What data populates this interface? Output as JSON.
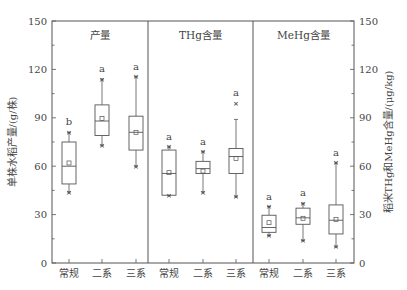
{
  "chart_data": {
    "type": "box",
    "title": "",
    "ylabel_left": "单株水稻产量/(g/株)",
    "ylabel_right": "稻米THg和MeHg含量/(μg/kg)",
    "ylim": [
      0,
      150
    ],
    "yticks": [
      0,
      30,
      60,
      90,
      120,
      150
    ],
    "grid": false,
    "categories": [
      "常规",
      "二系",
      "三系"
    ],
    "panels": [
      {
        "title": "产量",
        "axis": "left",
        "boxes": [
          {
            "category": "常规",
            "q1": 49,
            "median": 60,
            "q3": 75,
            "mean": 62,
            "whisker_low": 44,
            "whisker_high": 81,
            "min_marker": 44,
            "max_marker": 81,
            "sig": "b"
          },
          {
            "category": "二系",
            "q1": 79,
            "median": 88,
            "q3": 98,
            "mean": 89.5,
            "whisker_low": 73,
            "whisker_high": 114,
            "min_marker": 73,
            "max_marker": 114,
            "sig": "a"
          },
          {
            "category": "三系",
            "q1": 70,
            "median": 81,
            "q3": 91,
            "mean": 81,
            "whisker_low": 60,
            "whisker_high": 115.5,
            "min_marker": 60,
            "max_marker": 115.5,
            "sig": "a"
          }
        ]
      },
      {
        "title": "THg含量",
        "axis": "right",
        "boxes": [
          {
            "category": "常规",
            "q1": 42,
            "median": 55.5,
            "q3": 70,
            "mean": 56,
            "whisker_low": 42,
            "whisker_high": 72,
            "min_marker": 42,
            "max_marker": 72,
            "sig": "a"
          },
          {
            "category": "二系",
            "q1": 55.5,
            "median": 58.5,
            "q3": 63,
            "mean": 57,
            "whisker_low": 44,
            "whisker_high": 69,
            "min_marker": 44,
            "max_marker": 69,
            "sig": "a"
          },
          {
            "category": "三系",
            "q1": 55.5,
            "median": 66,
            "q3": 71,
            "mean": 64.8,
            "whisker_low": 41,
            "whisker_high": 89,
            "min_marker": 41,
            "max_marker": 99,
            "sig": "a"
          }
        ]
      },
      {
        "title": "MeHg含量",
        "axis": "right",
        "boxes": [
          {
            "category": "常规",
            "q1": 19,
            "median": 22,
            "q3": 29.6,
            "mean": 25,
            "whisker_low": 17,
            "whisker_high": 35,
            "min_marker": 17,
            "max_marker": 35,
            "sig": "a"
          },
          {
            "category": "二系",
            "q1": 24,
            "median": 28,
            "q3": 34,
            "mean": 27.7,
            "whisker_low": 14,
            "whisker_high": 37,
            "min_marker": 14,
            "max_marker": 37,
            "sig": "a"
          },
          {
            "category": "三系",
            "q1": 18,
            "median": 26.5,
            "q3": 36,
            "mean": 27,
            "whisker_low": 10,
            "whisker_high": 62,
            "min_marker": 10,
            "max_marker": 62,
            "sig": "a"
          }
        ]
      }
    ]
  },
  "colors": {
    "axis": "#555555",
    "box_stroke": "#555555",
    "text": "#444444",
    "background": "#ffffff"
  }
}
